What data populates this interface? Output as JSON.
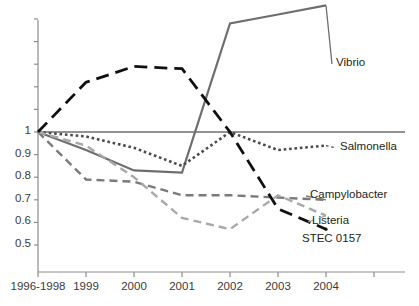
{
  "chart_data": {
    "type": "line",
    "title": "",
    "subtitle": "",
    "xlabel": "",
    "ylabel": "",
    "x": [
      "1996-1998",
      "1999",
      "2000",
      "2001",
      "2002",
      "2003",
      "2004"
    ],
    "xtick_labels": [
      "1996-1998",
      "1999",
      "2000",
      "2001",
      "2002",
      "2003",
      "2004"
    ],
    "ytick_labels": [
      "2",
      "1",
      "0.9",
      "0.8",
      "0.7",
      "0.6",
      "0.5"
    ],
    "ytick_values": [
      2,
      1,
      0.9,
      0.8,
      0.7,
      0.6,
      0.5
    ],
    "ylim": [
      0.45,
      2.0
    ],
    "grid": false,
    "reference_line": 1.0,
    "legend_position": "right-inline",
    "series": [
      {
        "name": "Vibrio",
        "color": "#6e6e6e",
        "style": "solid",
        "width": 2.2,
        "values": [
          1.0,
          0.92,
          0.83,
          0.82,
          1.48,
          1.52,
          1.56
        ],
        "label_x": 1.56
      },
      {
        "name": "Salmonella",
        "color": "#4a4a4a",
        "style": "dotted",
        "width": 2.6,
        "values": [
          1.0,
          0.98,
          0.93,
          0.85,
          1.0,
          0.92,
          0.94
        ],
        "label_x": 0.94
      },
      {
        "name": "Campylobacter",
        "color": "#7a7a7a",
        "style": "dashed",
        "width": 2.4,
        "values": [
          1.0,
          0.79,
          0.78,
          0.72,
          0.72,
          0.71,
          0.7
        ],
        "label_x": 0.7
      },
      {
        "name": "Listeria",
        "color": "#a8a8a8",
        "style": "dashed",
        "width": 2.4,
        "values": [
          1.0,
          0.94,
          0.8,
          0.62,
          0.57,
          0.72,
          0.63
        ],
        "label_x": 0.63
      },
      {
        "name": "STEC 0157",
        "color": "#101010",
        "style": "dashed-long",
        "width": 2.8,
        "values": [
          1.0,
          1.22,
          1.29,
          1.28,
          1.0,
          0.66,
          0.57
        ],
        "label_x": 0.57
      }
    ]
  }
}
